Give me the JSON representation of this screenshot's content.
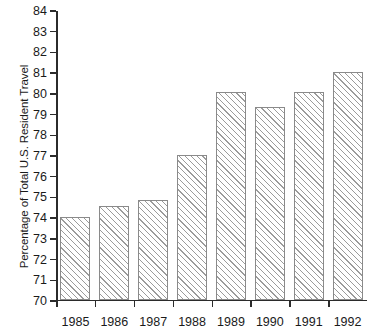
{
  "chart_data": {
    "type": "bar",
    "title": "",
    "subtitle": "",
    "xlabel": "",
    "ylabel": "Percentage of Total U.S. Resident Travel",
    "categories": [
      "1985",
      "1986",
      "1987",
      "1988",
      "1989",
      "1990",
      "1991",
      "1992"
    ],
    "values": [
      74.0,
      74.5,
      74.8,
      77.0,
      80.0,
      79.3,
      80.0,
      81.0
    ],
    "ylim": [
      70,
      84
    ],
    "ytick_labels": [
      "70",
      "71",
      "72",
      "73",
      "74",
      "75",
      "76",
      "77",
      "78",
      "79",
      "80",
      "81",
      "82",
      "83",
      "84"
    ],
    "ytick_values": [
      70,
      71,
      72,
      73,
      74,
      75,
      76,
      77,
      78,
      79,
      80,
      81,
      82,
      83,
      84
    ],
    "grid": false,
    "legend": null,
    "legend_position": "none",
    "bar_fill": "#ffffff",
    "bar_hatch": "diagonal-45",
    "bar_hatch_color": "#9b9b9b",
    "bar_border_color": "#8a8a8a",
    "axis_color": "#2b2b2b"
  }
}
